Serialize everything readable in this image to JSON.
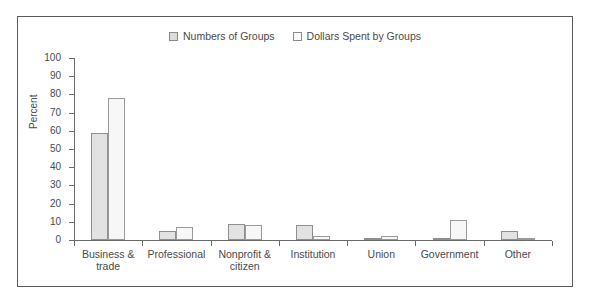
{
  "chart_data": {
    "type": "bar",
    "title": "",
    "xlabel": "",
    "ylabel": "Percent",
    "ylim": [
      0,
      100
    ],
    "yticks": [
      0,
      10,
      20,
      30,
      40,
      50,
      60,
      70,
      80,
      90,
      100
    ],
    "ytick_labels": [
      "0",
      "10",
      "20",
      "30",
      "40",
      "50",
      "60",
      "70",
      "80",
      "90",
      "100"
    ],
    "grid": false,
    "legend_position": "top-center",
    "categories": [
      "Business &\ntrade",
      "Professional",
      "Nonprofit &\ncitizen",
      "Institution",
      "Union",
      "Government",
      "Other"
    ],
    "series": [
      {
        "name": "Numbers of Groups",
        "color": "#e2e2e2",
        "values": [
          59,
          5,
          9,
          8,
          1,
          1,
          5
        ]
      },
      {
        "name": "Dollars Spent by Groups",
        "color": "#f7f7f7",
        "values": [
          78,
          7,
          8,
          2,
          2,
          11,
          1
        ]
      }
    ]
  },
  "legend": {
    "items": [
      {
        "label": "Numbers of Groups",
        "swatch": "legend-swatch-series0"
      },
      {
        "label": "Dollars Spent by Groups",
        "swatch": "legend-swatch-series1"
      }
    ]
  },
  "axis": {
    "y_title": "Percent"
  }
}
